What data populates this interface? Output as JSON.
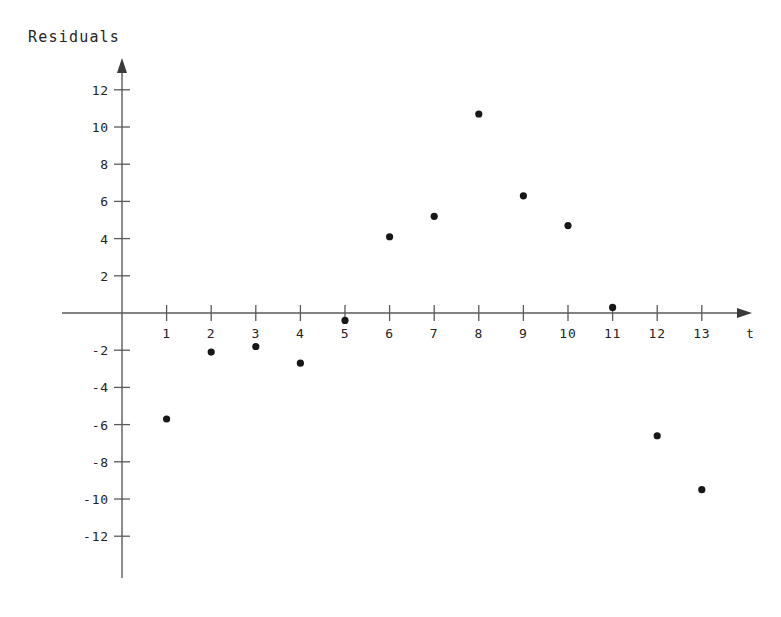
{
  "chart_data": {
    "type": "scatter",
    "title": "Residuals",
    "xlabel": "t",
    "ylabel": "",
    "x": [
      1,
      2,
      3,
      4,
      5,
      6,
      7,
      8,
      9,
      10,
      11,
      12,
      13
    ],
    "values": [
      -5.7,
      -2.1,
      -1.8,
      -2.7,
      -0.4,
      4.1,
      5.2,
      10.7,
      6.3,
      4.7,
      0.3,
      -6.6,
      -9.5
    ],
    "series": [
      {
        "name": "Residuals",
        "values": [
          -5.7,
          -2.1,
          -1.8,
          -2.7,
          -0.4,
          4.1,
          5.2,
          10.7,
          6.3,
          4.7,
          0.3,
          -6.6,
          -9.5
        ]
      }
    ],
    "xlim": [
      0,
      13.9
    ],
    "ylim": [
      -13.6,
      13.6
    ],
    "xticks": [
      1,
      2,
      3,
      4,
      5,
      6,
      7,
      8,
      9,
      10,
      11,
      12,
      13
    ],
    "xtick_labels": [
      "1",
      "2",
      "3",
      "4",
      "5",
      "6",
      "7",
      "8",
      "9",
      "10",
      "11",
      "12",
      "13"
    ],
    "yticks": [
      -12,
      -10,
      -8,
      -6,
      -4,
      -2,
      2,
      4,
      6,
      8,
      10,
      12
    ],
    "ytick_labels": [
      "-12",
      "-10",
      "-8",
      "-6",
      "-4",
      "-2",
      "2",
      "4",
      "6",
      "8",
      "10",
      "12"
    ],
    "grid": false,
    "legend": false,
    "legend_position": "none",
    "axis_style": "arrows",
    "point_color": "#171717",
    "axis_color": "#5a5a5a",
    "background_color": "#ffffff"
  }
}
